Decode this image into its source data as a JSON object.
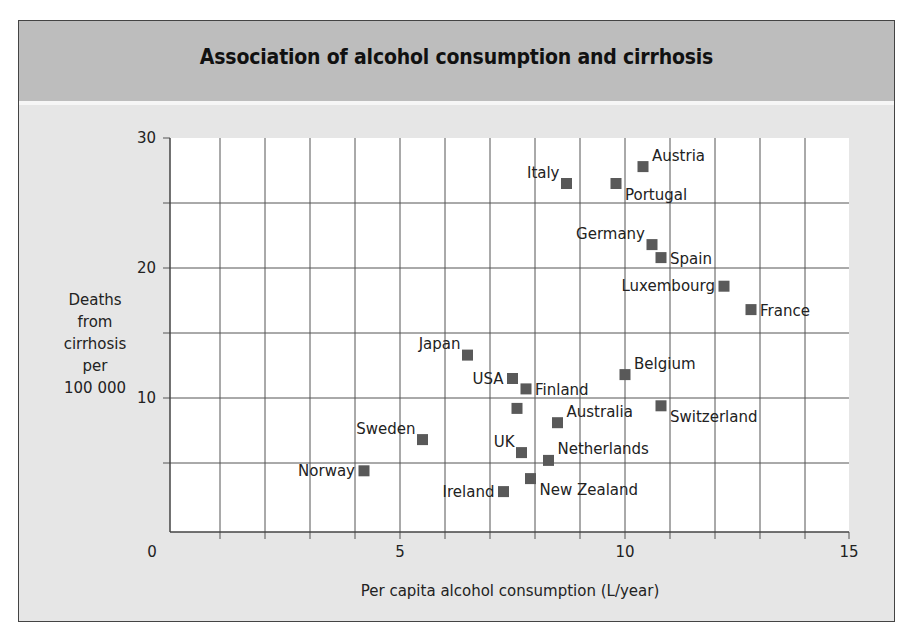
{
  "title": "Association of alcohol consumption and cirrhosis",
  "colors": {
    "header_band": "#bdbdbd",
    "panel_background": "#e6e6e6",
    "plot_background": "#ffffff",
    "grid": "#555555",
    "marker": "#595959"
  },
  "chart_data": {
    "type": "scatter",
    "title": "Association of alcohol consumption and cirrhosis",
    "xlabel": "Per capita alcohol consumption (L/year)",
    "ylabel": "Deaths from cirrhosis per 100 000",
    "ylabel_lines": [
      "Deaths",
      "from",
      "cirrhosis",
      "per",
      "100 000"
    ],
    "xlim": [
      0,
      15
    ],
    "ylim": [
      0,
      30
    ],
    "x_ticks": [
      0,
      5,
      10,
      15
    ],
    "y_ticks": [
      10,
      20,
      30
    ],
    "x_tick_labels": [
      "0",
      "5",
      "10",
      "15"
    ],
    "y_tick_labels": [
      "10",
      "20",
      "30"
    ],
    "x_minor_step": 1,
    "y_minor_step": 5,
    "grid": true,
    "legend": null,
    "marker": "square",
    "points": [
      {
        "label": "Norway",
        "x": 4.2,
        "y": 4.4,
        "label_pos": "left"
      },
      {
        "label": "Sweden",
        "x": 5.5,
        "y": 6.8,
        "label_pos": "above-left"
      },
      {
        "label": "Japan",
        "x": 6.5,
        "y": 13.3,
        "label_pos": "above-left"
      },
      {
        "label": "USA",
        "x": 7.5,
        "y": 11.5,
        "label_pos": "left"
      },
      {
        "label": "Finland",
        "x": 7.8,
        "y": 10.7,
        "label_pos": "right"
      },
      {
        "label": "",
        "x": 7.6,
        "y": 9.2,
        "label_pos": "none"
      },
      {
        "label": "UK",
        "x": 7.7,
        "y": 5.8,
        "label_pos": "above-left"
      },
      {
        "label": "Ireland",
        "x": 7.3,
        "y": 2.8,
        "label_pos": "left"
      },
      {
        "label": "New Zealand",
        "x": 7.9,
        "y": 3.8,
        "label_pos": "below-right"
      },
      {
        "label": "Netherlands",
        "x": 8.3,
        "y": 5.2,
        "label_pos": "above-right"
      },
      {
        "label": "Australia",
        "x": 8.5,
        "y": 8.1,
        "label_pos": "above-right"
      },
      {
        "label": "Italy",
        "x": 8.7,
        "y": 26.5,
        "label_pos": "above-left"
      },
      {
        "label": "Portugal",
        "x": 9.8,
        "y": 26.5,
        "label_pos": "below-right"
      },
      {
        "label": "Austria",
        "x": 10.4,
        "y": 27.8,
        "label_pos": "above-right"
      },
      {
        "label": "Belgium",
        "x": 10.0,
        "y": 11.8,
        "label_pos": "above-right"
      },
      {
        "label": "Germany",
        "x": 10.6,
        "y": 21.8,
        "label_pos": "above-left"
      },
      {
        "label": "Spain",
        "x": 10.8,
        "y": 20.8,
        "label_pos": "right"
      },
      {
        "label": "Switzerland",
        "x": 10.8,
        "y": 9.4,
        "label_pos": "below-right"
      },
      {
        "label": "Luxembourg",
        "x": 12.2,
        "y": 18.6,
        "label_pos": "left"
      },
      {
        "label": "France",
        "x": 12.8,
        "y": 16.8,
        "label_pos": "right"
      }
    ]
  }
}
